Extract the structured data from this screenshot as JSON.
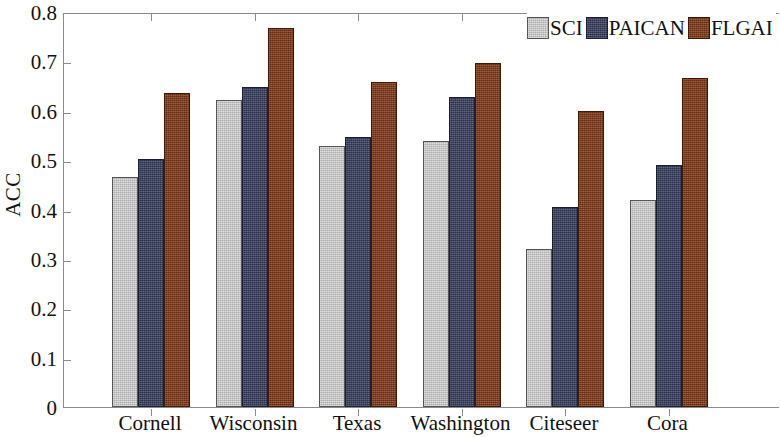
{
  "chart_data": {
    "type": "bar",
    "title": "",
    "xlabel": "",
    "ylabel": "ACC",
    "ylim": [
      0,
      0.8
    ],
    "yticks": [
      "0",
      "0.1",
      "0.2",
      "0.3",
      "0.4",
      "0.5",
      "0.6",
      "0.7",
      "0.8"
    ],
    "ytick_values": [
      0,
      0.1,
      0.2,
      0.3,
      0.4,
      0.5,
      0.6,
      0.7,
      0.8
    ],
    "grid": false,
    "legend_position": "top-right",
    "categories": [
      "Cornell",
      "Wisconsin",
      "Texas",
      "Washington",
      "Citeseer",
      "Cora"
    ],
    "series": [
      {
        "name": "SCI",
        "color": "#c0c0c0",
        "values": [
          0.466,
          0.622,
          0.529,
          0.539,
          0.32,
          0.42
        ]
      },
      {
        "name": "PAICAN",
        "color": "#3d4465",
        "values": [
          0.503,
          0.648,
          0.547,
          0.627,
          0.406,
          0.49
        ]
      },
      {
        "name": "FLGAI",
        "color": "#8a3e1c",
        "values": [
          0.635,
          0.768,
          0.659,
          0.697,
          0.6,
          0.667
        ]
      }
    ]
  },
  "axes": {
    "y_title": "ACC"
  },
  "legend": {
    "items": [
      {
        "label": "SCI",
        "color": "#c0c0c0"
      },
      {
        "label": "PAICAN",
        "color": "#3d4465"
      },
      {
        "label": "FLGAI",
        "color": "#8a3e1c"
      }
    ]
  }
}
